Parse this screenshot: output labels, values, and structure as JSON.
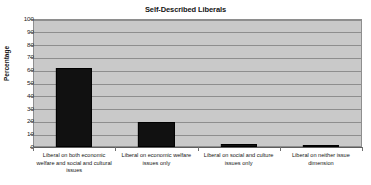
{
  "chart_data": {
    "type": "bar",
    "title": "Self-Described Liberals",
    "xlabel": "",
    "ylabel": "Percentage",
    "ylim": [
      0,
      100
    ],
    "ytick_step": 10,
    "yticks": [
      100,
      90,
      80,
      70,
      60,
      50,
      40,
      30,
      20,
      10,
      0
    ],
    "grid": true,
    "legend": false,
    "categories": [
      "Liberal on both economic welfare and social and cultural issues",
      "Liberal on economic welfare issues only",
      "Liberal on social and culture issues only",
      "Liberal on neither issue dimension"
    ],
    "values": [
      62,
      19.5,
      2.5,
      1.5
    ],
    "colors": {
      "bar": "#111111",
      "plot_background": "#c9c9c9",
      "gridline": "#8e8e8e",
      "axis": "#5d5d5d",
      "text": "#141414",
      "page_background": "#ffffff"
    }
  }
}
